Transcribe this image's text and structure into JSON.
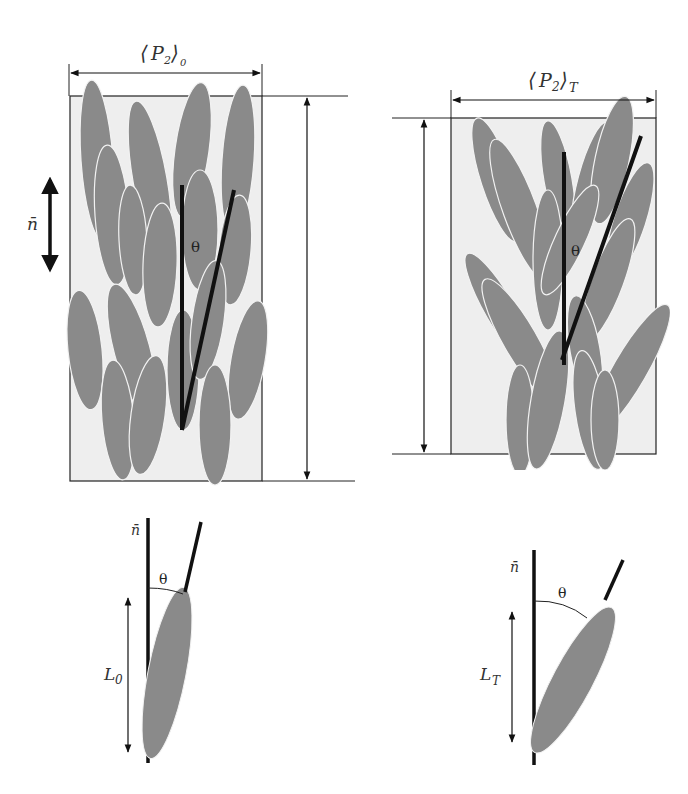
{
  "colors": {
    "background": "#ffffff",
    "box_fill": "#eeeeee",
    "ellipse_fill": "#8a8a8a",
    "ellipse_stroke": "#f2f2f2",
    "line": "#111111"
  },
  "left_panel": {
    "width_label_main": "P",
    "width_label_sub": "2",
    "width_label_outer_sub": "0",
    "director_label": "n̄",
    "angle_label": "θ"
  },
  "right_panel": {
    "width_label_main": "P",
    "width_label_sub": "2",
    "width_label_outer_sub": "T",
    "angle_label": "θ"
  },
  "bottom_left": {
    "director_label": "n̄",
    "angle_label": "θ",
    "length_label_main": "L",
    "length_label_sub": "0"
  },
  "bottom_right": {
    "director_label": "n̄",
    "angle_label": "θ",
    "length_label_main": "L",
    "length_label_sub": "T"
  }
}
